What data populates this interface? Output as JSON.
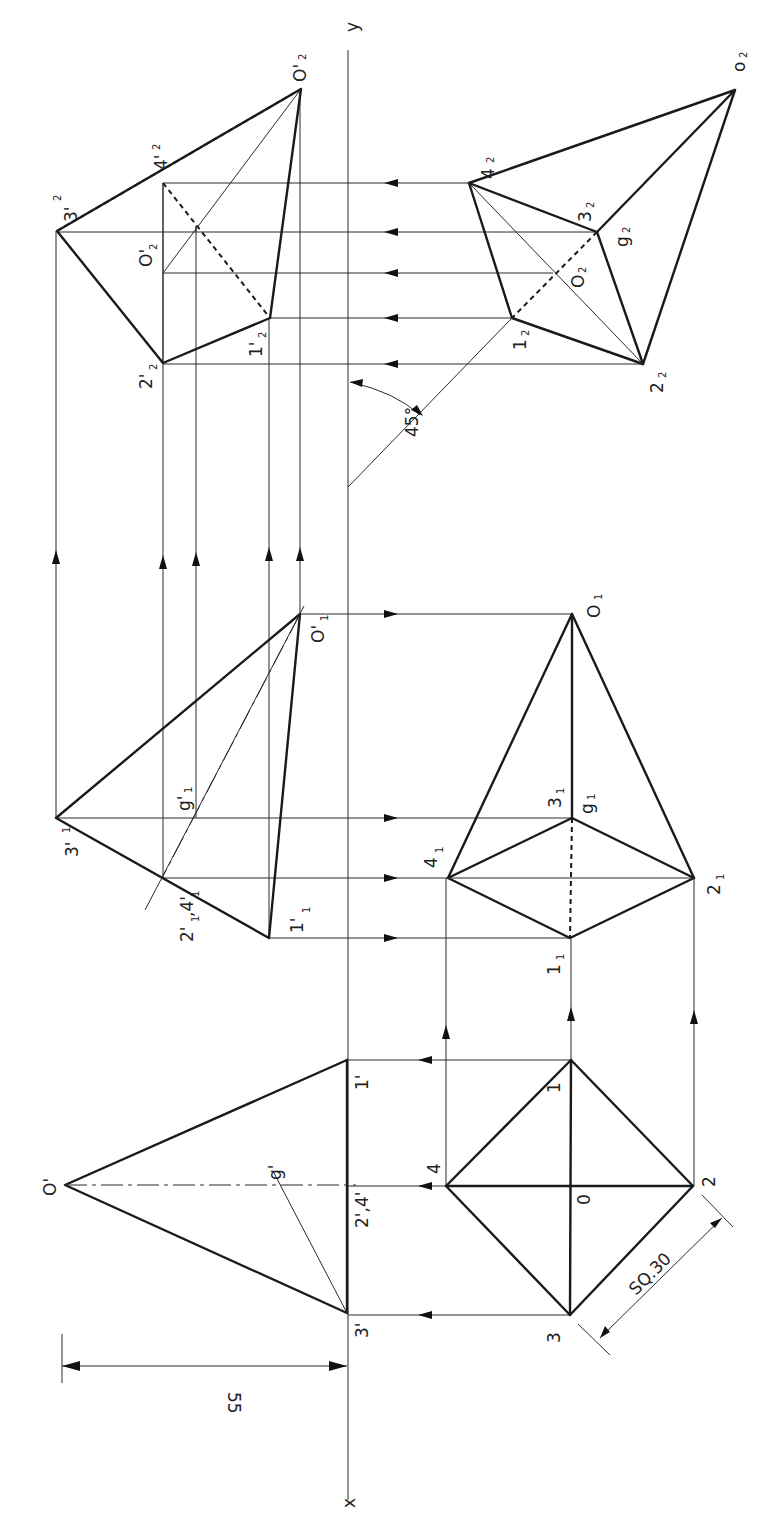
{
  "diagram": {
    "reference_line": {
      "x_label": "x",
      "y_label": "y"
    },
    "dimensions": {
      "height": "55",
      "base_square": "SQ.30",
      "angle": "45°"
    },
    "front_view": {
      "labels": {
        "apex": "O'",
        "p3": "3'",
        "p24": "2',4'",
        "p1": "1'",
        "g": "g'"
      }
    },
    "top_view": {
      "labels": {
        "p1": "1",
        "p2": "2",
        "p3": "3",
        "p4": "4",
        "center": "0"
      }
    },
    "aux1_front": {
      "labels": {
        "p3": "3'",
        "p24a": "2'",
        "p24b": ",4'",
        "p1": "1'",
        "apex": "O'",
        "g": "g'"
      },
      "subscript": "1"
    },
    "aux1_top": {
      "labels": {
        "apex": "O",
        "p3": "3",
        "g": "g",
        "p4": "4",
        "p2": "2",
        "p1": "1"
      },
      "subscript": "1"
    },
    "aux2_front": {
      "labels": {
        "p3": "3'",
        "p4": "4'",
        "apex": "O'",
        "center": "O'",
        "p2": "2'",
        "p1": "1'"
      },
      "subscript": "2"
    },
    "aux2_top": {
      "labels": {
        "p4": "4",
        "p3": "3",
        "g": "g",
        "center": "O",
        "p1": "1",
        "p2": "2",
        "apex": "o"
      },
      "subscript": "2"
    }
  }
}
